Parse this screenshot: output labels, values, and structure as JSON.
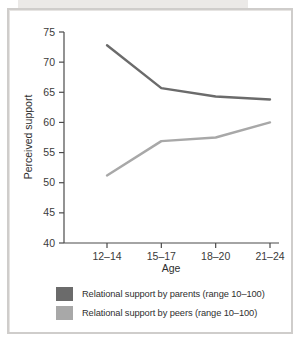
{
  "figure": {
    "frame_border_color": "#cfcdcb",
    "background": "#ffffff"
  },
  "chart_data": {
    "type": "line",
    "title": "",
    "xlabel": "Age",
    "ylabel": "Perceived support",
    "categories": [
      "12–14",
      "15–17",
      "18–20",
      "21–24"
    ],
    "ylim": [
      40,
      75
    ],
    "yticks": [
      40,
      45,
      50,
      55,
      60,
      65,
      70,
      75
    ],
    "ytick_labels": [
      "40",
      "45",
      "50",
      "55",
      "60",
      "65",
      "70",
      "75"
    ],
    "grid": false,
    "legend_position": "below",
    "series": [
      {
        "name": "Relational support by parents (range 10–100)",
        "short_name": "parents",
        "color": "#6b6b6b",
        "values": [
          72.8,
          65.7,
          64.3,
          63.8
        ]
      },
      {
        "name": "Relational support by peers (range 10–100)",
        "short_name": "peers",
        "color": "#a8a8a8",
        "values": [
          51.2,
          56.9,
          57.5,
          60.0
        ]
      }
    ]
  },
  "legend": {
    "items": [
      {
        "label": "Relational support by parents (range 10–100)",
        "color": "#6b6b6b"
      },
      {
        "label": "Relational support by peers (range 10–100)",
        "color": "#a8a8a8"
      }
    ]
  },
  "axes": {
    "y_title": "Perceived support",
    "x_title": "Age",
    "y_labels": [
      "75",
      "70",
      "65",
      "60",
      "55",
      "50",
      "45",
      "40"
    ],
    "x_labels": [
      "12–14",
      "15–17",
      "18–20",
      "21–24"
    ]
  }
}
